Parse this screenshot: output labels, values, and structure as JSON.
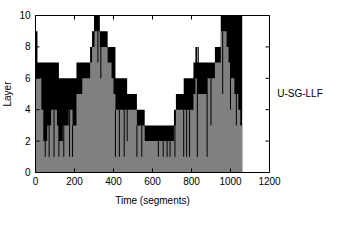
{
  "figure": {
    "background_color": "#ffffff",
    "side_label": "U-SG-LLF"
  },
  "chart_data": {
    "type": "area",
    "title": "",
    "subtitle": "",
    "xlabel": "Time (segments)",
    "ylabel": "Layer",
    "xlim": [
      0,
      1200
    ],
    "ylim": [
      0,
      10
    ],
    "xticks": [
      0,
      200,
      400,
      600,
      800,
      1000,
      1200
    ],
    "xticklabels": [
      "0",
      "200",
      "400",
      "600",
      "800",
      "1000",
      "1200"
    ],
    "yticks": [
      0,
      2,
      4,
      6,
      8,
      10
    ],
    "yticklabels": [
      "0",
      "2",
      "4",
      "6",
      "8",
      "10"
    ],
    "grid": false,
    "legend": [],
    "legend_position": "none",
    "annotations": [
      "U-SG-LLF"
    ],
    "series": [
      {
        "name": "upper-envelope",
        "color": "#000000",
        "description": "Maximum layer reached in each time segment (black silhouette)",
        "x": [
          0,
          10,
          20,
          30,
          40,
          50,
          60,
          70,
          80,
          90,
          100,
          110,
          120,
          130,
          140,
          150,
          160,
          170,
          180,
          190,
          200,
          210,
          220,
          230,
          240,
          250,
          260,
          270,
          280,
          290,
          300,
          310,
          320,
          330,
          340,
          350,
          360,
          370,
          380,
          390,
          400,
          410,
          420,
          430,
          440,
          450,
          460,
          470,
          480,
          490,
          500,
          510,
          520,
          530,
          540,
          550,
          560,
          570,
          580,
          590,
          600,
          610,
          620,
          630,
          640,
          650,
          660,
          670,
          680,
          690,
          700,
          710,
          720,
          730,
          740,
          750,
          760,
          770,
          780,
          790,
          800,
          810,
          820,
          830,
          840,
          850,
          860,
          870,
          880,
          890,
          900,
          910,
          920,
          930,
          940,
          950,
          960,
          970,
          980,
          990,
          1000,
          1010,
          1020,
          1030,
          1040,
          1050
        ],
        "values": [
          9,
          7,
          7,
          7,
          7,
          7,
          7,
          7,
          7,
          7,
          7,
          7,
          6,
          6,
          6,
          6,
          6,
          6,
          6,
          6,
          6,
          7,
          7,
          7,
          7,
          7,
          7,
          7,
          8,
          9,
          10,
          10,
          10,
          9,
          9,
          9,
          9,
          8,
          8,
          8,
          8,
          6,
          6,
          6,
          6,
          6,
          6,
          5,
          5,
          5,
          5,
          5,
          4,
          4,
          4,
          4,
          3,
          3,
          3,
          3,
          3,
          3,
          3,
          3,
          3,
          3,
          3,
          3,
          3,
          3,
          3,
          4,
          5,
          5,
          5,
          5,
          6,
          6,
          6,
          6,
          6,
          7,
          8,
          7,
          7,
          7,
          7,
          7,
          7,
          7,
          7,
          7,
          8,
          8,
          8,
          10,
          10,
          10,
          10,
          10,
          10,
          10,
          10,
          10,
          10,
          10
        ]
      },
      {
        "name": "filled-level",
        "color": "#808080",
        "description": "Solid gray fill level (typical / lower layer envelope)",
        "x": [
          0,
          10,
          20,
          30,
          40,
          50,
          60,
          70,
          80,
          90,
          100,
          110,
          120,
          130,
          140,
          150,
          160,
          170,
          180,
          190,
          200,
          210,
          220,
          230,
          240,
          250,
          260,
          270,
          280,
          290,
          300,
          310,
          320,
          330,
          340,
          350,
          360,
          370,
          380,
          390,
          400,
          410,
          420,
          430,
          440,
          450,
          460,
          470,
          480,
          490,
          500,
          510,
          520,
          530,
          540,
          550,
          560,
          570,
          580,
          590,
          600,
          610,
          620,
          630,
          640,
          650,
          660,
          670,
          680,
          690,
          700,
          710,
          720,
          730,
          740,
          750,
          760,
          770,
          780,
          790,
          800,
          810,
          820,
          830,
          840,
          850,
          860,
          870,
          880,
          890,
          900,
          910,
          920,
          930,
          940,
          950,
          960,
          970,
          980,
          990,
          1000,
          1010,
          1020,
          1030,
          1040,
          1050
        ],
        "values": [
          6,
          6,
          6,
          4,
          2,
          2,
          3,
          3,
          4,
          4,
          4,
          3,
          2,
          2,
          3,
          3,
          3,
          4,
          4,
          3,
          3,
          5,
          5,
          5,
          6,
          6,
          6,
          6,
          7,
          8,
          9,
          9,
          9,
          8,
          8,
          8,
          8,
          7,
          7,
          6,
          5,
          4,
          4,
          4,
          4,
          4,
          4,
          4,
          4,
          4,
          4,
          4,
          3,
          3,
          3,
          3,
          2,
          2,
          2,
          2,
          2,
          2,
          2,
          2,
          2,
          2,
          2,
          2,
          2,
          2,
          2,
          3,
          4,
          4,
          4,
          4,
          4,
          4,
          4,
          4,
          4,
          5,
          6,
          5,
          5,
          5,
          5,
          5,
          6,
          6,
          6,
          6,
          7,
          7,
          7,
          9,
          9,
          9,
          8,
          7,
          6,
          6,
          5,
          5,
          4,
          3
        ]
      },
      {
        "name": "downward-spikes",
        "color": "#000000",
        "description": "Narrow vertical excursions dropping toward layer 1",
        "spikes": [
          {
            "x": 50,
            "from": 6,
            "to": 1
          },
          {
            "x": 70,
            "from": 4,
            "to": 1
          },
          {
            "x": 95,
            "from": 4,
            "to": 1
          },
          {
            "x": 120,
            "from": 3,
            "to": 1
          },
          {
            "x": 145,
            "from": 3,
            "to": 1
          },
          {
            "x": 175,
            "from": 4,
            "to": 1
          },
          {
            "x": 190,
            "from": 3,
            "to": 1
          },
          {
            "x": 300,
            "from": 9,
            "to": 8
          },
          {
            "x": 320,
            "from": 9,
            "to": 7
          },
          {
            "x": 335,
            "from": 8,
            "to": 6
          },
          {
            "x": 410,
            "from": 4,
            "to": 1
          },
          {
            "x": 430,
            "from": 4,
            "to": 1
          },
          {
            "x": 455,
            "from": 4,
            "to": 1
          },
          {
            "x": 470,
            "from": 4,
            "to": 2
          },
          {
            "x": 520,
            "from": 3,
            "to": 1
          },
          {
            "x": 545,
            "from": 3,
            "to": 1
          },
          {
            "x": 630,
            "from": 2,
            "to": 1
          },
          {
            "x": 655,
            "from": 2,
            "to": 1
          },
          {
            "x": 675,
            "from": 2,
            "to": 1
          },
          {
            "x": 690,
            "from": 2,
            "to": 1
          },
          {
            "x": 715,
            "from": 3,
            "to": 1
          },
          {
            "x": 760,
            "from": 4,
            "to": 1
          },
          {
            "x": 775,
            "from": 4,
            "to": 1
          },
          {
            "x": 790,
            "from": 4,
            "to": 1
          },
          {
            "x": 830,
            "from": 6,
            "to": 1
          },
          {
            "x": 835,
            "from": 8,
            "to": 5
          },
          {
            "x": 880,
            "from": 6,
            "to": 1
          },
          {
            "x": 900,
            "from": 6,
            "to": 3
          },
          {
            "x": 960,
            "from": 9,
            "to": 5
          },
          {
            "x": 1000,
            "from": 9,
            "to": 4
          },
          {
            "x": 1030,
            "from": 5,
            "to": 3
          }
        ]
      }
    ]
  }
}
